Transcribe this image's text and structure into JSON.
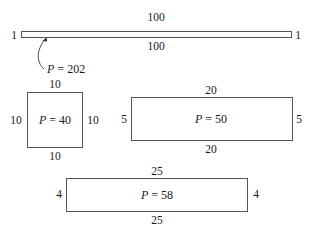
{
  "figure": {
    "type": "perimeter-comparison-diagram",
    "shapes": [
      {
        "id": "strip",
        "dimensions": {
          "length": 100,
          "width": 1
        },
        "labels": {
          "top": "100",
          "bottom": "100",
          "left": "1",
          "right": "1"
        },
        "perimeter_var": "P",
        "perimeter_eq": " = ",
        "perimeter_value": "202",
        "perimeter_text": "P = 202",
        "callout": "arrow"
      },
      {
        "id": "square",
        "dimensions": {
          "length": 10,
          "width": 10
        },
        "labels": {
          "top": "10",
          "bottom": "10",
          "left": "10",
          "right": "10"
        },
        "perimeter_var": "P",
        "perimeter_eq": " = ",
        "perimeter_value": "40",
        "perimeter_text": "P = 40"
      },
      {
        "id": "rect-20x5",
        "dimensions": {
          "length": 20,
          "width": 5
        },
        "labels": {
          "top": "20",
          "bottom": "20",
          "left": "5",
          "right": "5"
        },
        "perimeter_var": "P",
        "perimeter_eq": " = ",
        "perimeter_value": "50",
        "perimeter_text": "P = 50"
      },
      {
        "id": "rect-25x4",
        "dimensions": {
          "length": 25,
          "width": 4
        },
        "labels": {
          "top": "25",
          "bottom": "25",
          "left": "4",
          "right": "4"
        },
        "perimeter_var": "P",
        "perimeter_eq": " = ",
        "perimeter_value": "58",
        "perimeter_text": "P = 58"
      }
    ]
  }
}
